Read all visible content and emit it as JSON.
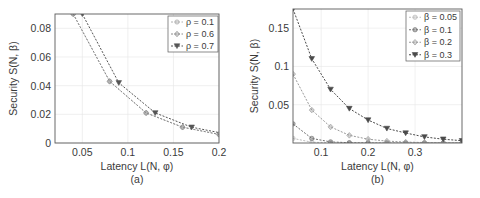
{
  "chart_data": [
    {
      "type": "line",
      "panel_label": "(a)",
      "title": "",
      "xlabel": "Latency L(N, φ)",
      "ylabel": "Security S(N, β)",
      "xlim": [
        0.02,
        0.2
      ],
      "ylim": [
        0,
        0.09
      ],
      "xticks": [
        "0.05",
        "0.1",
        "0.15",
        "0.2"
      ],
      "yticks": [
        "0",
        "0.02",
        "0.04",
        "0.06",
        "0.08"
      ],
      "grid": true,
      "legend_position": "upper right",
      "series": [
        {
          "name": "ρ = 0.1",
          "marker": "circle",
          "color": "#b0b0b0",
          "x": [
            0.04,
            0.08,
            0.12,
            0.16,
            0.2
          ],
          "y": [
            0.09,
            0.043,
            0.021,
            0.011,
            0.006
          ]
        },
        {
          "name": "ρ = 0.6",
          "marker": "diamond",
          "color": "#8c8c8c",
          "x": [
            0.04,
            0.08,
            0.12,
            0.16,
            0.2
          ],
          "y": [
            0.09,
            0.043,
            0.021,
            0.011,
            0.006
          ]
        },
        {
          "name": "ρ = 0.7",
          "marker": "triangle-down",
          "color": "#555555",
          "x": [
            0.05,
            0.09,
            0.13,
            0.17,
            0.21
          ],
          "y": [
            0.09,
            0.042,
            0.021,
            0.011,
            0.006
          ]
        }
      ]
    },
    {
      "type": "line",
      "panel_label": "(b)",
      "title": "",
      "xlabel": "Latency L(N, φ)",
      "ylabel": "Security S(N, β)",
      "xlim": [
        0.04,
        0.4
      ],
      "ylim": [
        0,
        0.175
      ],
      "xticks": [
        "0.1",
        "0.2",
        "0.3"
      ],
      "yticks": [
        "0.05",
        "0.1",
        "0.15"
      ],
      "grid": true,
      "legend_position": "upper right",
      "series": [
        {
          "name": "β = 0.05",
          "marker": "circle",
          "color": "#bdbdbd",
          "x": [
            0.04,
            0.08,
            0.12,
            0.16,
            0.2,
            0.24,
            0.28,
            0.32,
            0.36,
            0.4
          ],
          "y": [
            0.006,
            0.001,
            0.0002,
            0,
            0,
            0,
            0,
            0,
            0,
            0
          ]
        },
        {
          "name": "β = 0.1",
          "marker": "circle",
          "color": "#707070",
          "x": [
            0.04,
            0.08,
            0.12,
            0.16,
            0.2,
            0.24,
            0.28,
            0.32,
            0.36,
            0.4
          ],
          "y": [
            0.025,
            0.006,
            0.0015,
            0.0004,
            0.0001,
            0,
            0,
            0,
            0,
            0
          ]
        },
        {
          "name": "β = 0.2",
          "marker": "diamond",
          "color": "#9a9a9a",
          "x": [
            0.04,
            0.08,
            0.12,
            0.16,
            0.2,
            0.24,
            0.28,
            0.32,
            0.36,
            0.4
          ],
          "y": [
            0.09,
            0.043,
            0.021,
            0.01,
            0.005,
            0.0025,
            0.0012,
            0.0006,
            0.0003,
            0.0001
          ]
        },
        {
          "name": "β = 0.3",
          "marker": "triangle-down",
          "color": "#4a4a4a",
          "x": [
            0.04,
            0.08,
            0.12,
            0.16,
            0.2,
            0.24,
            0.28,
            0.32,
            0.36,
            0.4
          ],
          "y": [
            0.175,
            0.11,
            0.07,
            0.045,
            0.03,
            0.019,
            0.013,
            0.008,
            0.005,
            0.003
          ]
        }
      ]
    }
  ]
}
